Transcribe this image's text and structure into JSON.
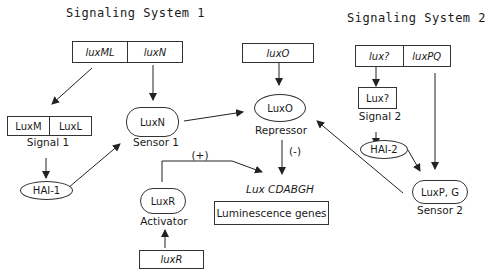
{
  "titles": {
    "system1": "Signaling System 1",
    "system2": "Signaling System 2"
  },
  "genes": {
    "luxML": "luxML",
    "luxN": "luxN",
    "luxO": "luxO",
    "luxUnknown": "lux?",
    "luxPQ": "luxPQ",
    "luxR": "luxR"
  },
  "proteins": {
    "luxM": "LuxM",
    "luxL": "LuxL",
    "luxN": "LuxN",
    "luxO": "LuxO",
    "luxUnknown": "Lux?",
    "luxR": "LuxR",
    "luxPG": "LuxP, G"
  },
  "signals": {
    "hai1": "HAI-1",
    "hai2": "HAI-2"
  },
  "labels": {
    "signal1": "Signal 1",
    "signal2": "Signal 2",
    "sensor1": "Sensor 1",
    "sensor2": "Sensor 2",
    "repressor": "Repressor",
    "activator": "Activator",
    "positive": "(+)",
    "negative": "(-)",
    "operon": "Lux CDABGH",
    "luminescence": "Luminescence genes"
  }
}
